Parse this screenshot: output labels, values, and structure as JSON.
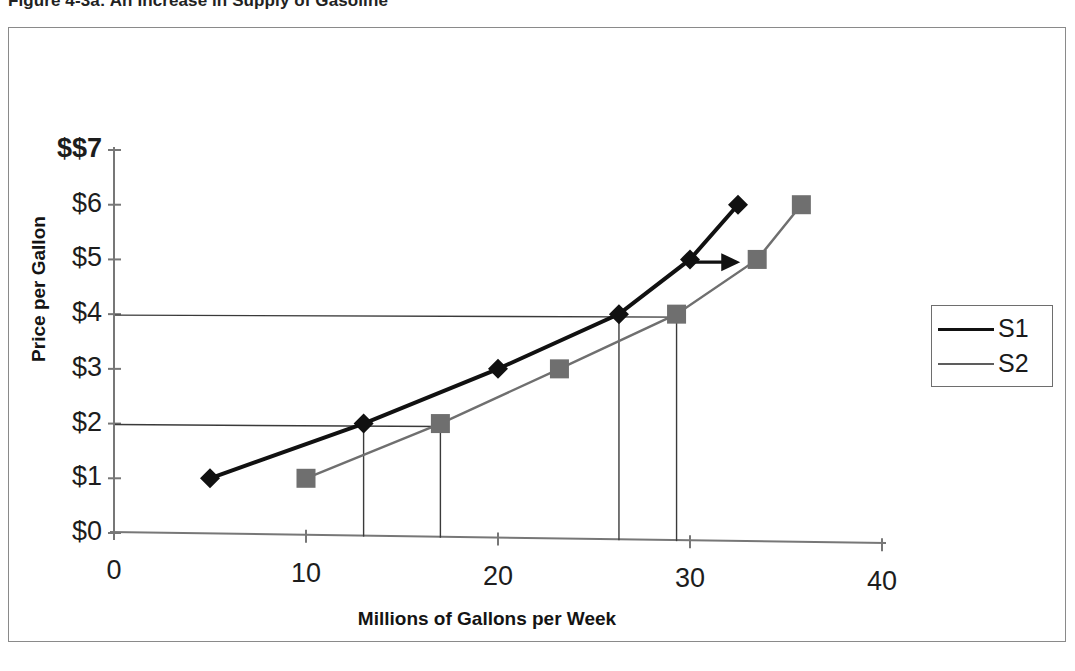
{
  "figure": {
    "title": "Figure 4-3a: An Increase in Supply of Gasoline"
  },
  "axes": {
    "x_title": "Millions of Gallons per Week",
    "y_title": "Price per Gallon",
    "x_ticks": [
      "0",
      "10",
      "20",
      "30",
      "40"
    ],
    "y_ticks": [
      "$$7",
      "$6",
      "$5",
      "$4",
      "$3",
      "$2",
      "$1",
      "$0"
    ]
  },
  "legend": {
    "items": [
      {
        "label": "S1",
        "marker": "diamond-marker",
        "color": "#111111"
      },
      {
        "label": "S2",
        "marker": "square-marker",
        "color": "#6f6f6f"
      }
    ]
  },
  "chart_data": {
    "type": "line",
    "title": "Figure 4-3a: An Increase in Supply of Gasoline",
    "xlabel": "Millions of Gallons per Week",
    "ylabel": "Price per Gallon",
    "xlim": [
      0,
      40
    ],
    "ylim": [
      0,
      7
    ],
    "x_ticks": [
      0,
      10,
      20,
      30,
      40
    ],
    "y_ticks": [
      0,
      1,
      2,
      3,
      4,
      5,
      6,
      7
    ],
    "y_tick_labels": [
      "$0",
      "$1",
      "$2",
      "$3",
      "$4",
      "$5",
      "$6",
      "$$7"
    ],
    "grid": false,
    "legend_position": "right",
    "series": [
      {
        "name": "S1",
        "marker": "diamond",
        "color": "#111111",
        "points": [
          {
            "x": 5.0,
            "y": 1
          },
          {
            "x": 13.0,
            "y": 2
          },
          {
            "x": 20.0,
            "y": 3
          },
          {
            "x": 26.3,
            "y": 4
          },
          {
            "x": 30.0,
            "y": 5
          },
          {
            "x": 32.5,
            "y": 6
          }
        ]
      },
      {
        "name": "S2",
        "marker": "square",
        "color": "#6f6f6f",
        "points": [
          {
            "x": 10.0,
            "y": 1
          },
          {
            "x": 17.0,
            "y": 2
          },
          {
            "x": 23.2,
            "y": 3
          },
          {
            "x": 29.3,
            "y": 4
          },
          {
            "x": 33.5,
            "y": 5
          },
          {
            "x": 35.8,
            "y": 6
          }
        ]
      }
    ],
    "reference_lines": [
      {
        "type": "horizontal",
        "y": 4,
        "from_x": 0,
        "to_x": 29.3
      },
      {
        "type": "horizontal",
        "y": 2,
        "from_x": 0,
        "to_x": 17.0
      },
      {
        "type": "vertical",
        "x": 13.0,
        "from_y": 0,
        "to_y": 2
      },
      {
        "type": "vertical",
        "x": 17.0,
        "from_y": 0,
        "to_y": 2
      },
      {
        "type": "vertical",
        "x": 26.3,
        "from_y": 0,
        "to_y": 4
      },
      {
        "type": "vertical",
        "x": 29.3,
        "from_y": 0,
        "to_y": 4
      }
    ],
    "annotations": [
      {
        "type": "arrow",
        "label": "supply-shift-arrow",
        "from_x": 30.0,
        "from_y": 4.95,
        "to_x": 32.2,
        "to_y": 4.95
      }
    ]
  },
  "geometry": {
    "x0_px": 114,
    "x40_px": 882,
    "y0_px": 533,
    "y7_px": 150
  }
}
